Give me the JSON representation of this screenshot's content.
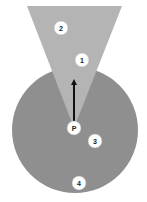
{
  "diagram": {
    "colors": {
      "background": "#ffffff",
      "circle_fill": "#8f8f8f",
      "cone_fill": "#b4b4b4",
      "marker_fill": "#ffffff",
      "arrow": "#111111"
    },
    "markers": [
      {
        "id": "2",
        "label": "2",
        "cx": 61,
        "cy": 28
      },
      {
        "id": "1",
        "label": "1",
        "cx": 82,
        "cy": 60
      },
      {
        "id": "P",
        "label": "P",
        "cx": 74,
        "cy": 128
      },
      {
        "id": "3",
        "label": "3",
        "cx": 95,
        "cy": 141
      },
      {
        "id": "4",
        "label": "4",
        "cx": 79,
        "cy": 183
      }
    ]
  }
}
